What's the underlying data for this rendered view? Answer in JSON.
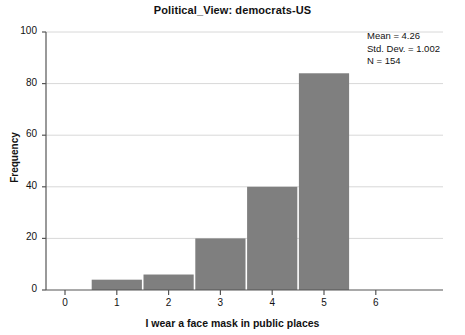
{
  "chart_data": {
    "type": "bar",
    "title": "Political_View: democrats-US",
    "xlabel": "I wear a face mask in public places",
    "ylabel": "Frequency",
    "categories": [
      "1",
      "2",
      "3",
      "4",
      "5"
    ],
    "values": [
      4,
      6,
      20,
      40,
      84
    ],
    "x": [
      1,
      2,
      3,
      4,
      5
    ],
    "xlim": [
      -0.5,
      6.5
    ],
    "ylim": [
      0,
      100
    ],
    "xticks": [
      "0",
      "1",
      "2",
      "3",
      "4",
      "5",
      "6"
    ],
    "yticks": [
      "0",
      "20",
      "40",
      "60",
      "80",
      "100"
    ],
    "grid": "horizontal",
    "legend": "none",
    "bar_color": "#7f7f7f",
    "bar_edge_color": "#ffffff",
    "overlay": {
      "type": "normal-curve",
      "color": "#111111",
      "peak_x": 4.26,
      "peak_y": 61
    },
    "annotations": {
      "mean_label": "Mean = 4.26",
      "std_dev_label": "Std. Dev. = 1.002",
      "n_label": "N = 154"
    }
  }
}
